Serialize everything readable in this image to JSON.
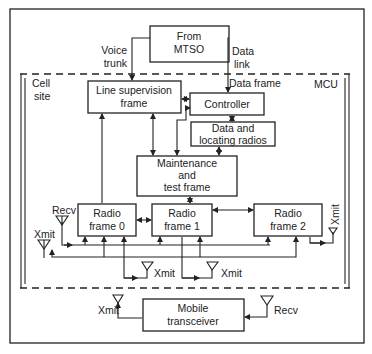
{
  "diagram": {
    "type": "block-diagram",
    "external": {
      "mtso": {
        "line1": "From",
        "line2": "MTSO"
      },
      "voice_trunk": {
        "line1": "Voice",
        "line2": "trunk"
      },
      "data_link": {
        "line1": "Data",
        "line2": "link"
      }
    },
    "cell_site": {
      "label_line1": "Cell",
      "label_line2": "site",
      "mcu_label": "MCU",
      "data_frame_label": "Data frame"
    },
    "blocks": {
      "line_supervision": {
        "line1": "Line supervision",
        "line2": "frame"
      },
      "controller": {
        "label": "Controller"
      },
      "data_locating": {
        "line1": "Data and",
        "line2": "locating radios"
      },
      "maintenance": {
        "line1": "Maintenance",
        "line2": "and",
        "line3": "test frame"
      },
      "radio0": {
        "line1": "Radio",
        "line2": "frame 0"
      },
      "radio1": {
        "line1": "Radio",
        "line2": "frame 1"
      },
      "radio2": {
        "line1": "Radio",
        "line2": "frame 2"
      },
      "mobile": {
        "line1": "Mobile",
        "line2": "transceiver"
      }
    },
    "antennas": {
      "recv_left": "Recv",
      "xmit_left": "Xmit",
      "xmit_right": "Xmit",
      "xmit_bottom1": "Xmit",
      "xmit_bottom2": "Xmit",
      "mobile_xmit": "Xmit",
      "mobile_recv": "Recv"
    }
  }
}
